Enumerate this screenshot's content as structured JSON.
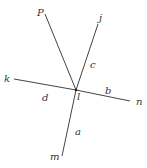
{
  "diagram": {
    "type": "intersecting-lines",
    "center": {
      "label": "l",
      "x": 76,
      "y": 90
    },
    "rays": [
      {
        "name": "P",
        "from": [
          76,
          90
        ],
        "to": [
          45,
          14
        ]
      },
      {
        "name": "j",
        "from": [
          76,
          90
        ],
        "to": [
          98,
          24
        ]
      },
      {
        "name": "k",
        "from": [
          76,
          90
        ],
        "to": [
          14,
          79
        ]
      },
      {
        "name": "n",
        "from": [
          76,
          90
        ],
        "to": [
          130,
          101
        ]
      },
      {
        "name": "m",
        "from": [
          76,
          90
        ],
        "to": [
          62,
          156
        ]
      }
    ],
    "point_labels": [
      {
        "text": "P",
        "x": 37,
        "y": 16
      },
      {
        "text": "j",
        "x": 99,
        "y": 21
      },
      {
        "text": "k",
        "x": 4,
        "y": 82
      },
      {
        "text": "n",
        "x": 136,
        "y": 105
      },
      {
        "text": "m",
        "x": 50,
        "y": 160
      },
      {
        "text": "l",
        "x": 77,
        "y": 100
      }
    ],
    "segment_labels": [
      {
        "text": "c",
        "x": 90,
        "y": 68
      },
      {
        "text": "b",
        "x": 105,
        "y": 94
      },
      {
        "text": "d",
        "x": 42,
        "y": 101
      },
      {
        "text": "a",
        "x": 75,
        "y": 135
      }
    ],
    "colors": {
      "line": "#444444",
      "text": "#333333",
      "background": "#ffffff"
    }
  }
}
